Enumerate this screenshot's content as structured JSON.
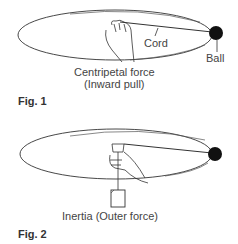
{
  "figures": [
    {
      "id": "fig1",
      "caption": "Fig. 1",
      "labels": {
        "cord": "Cord",
        "ball": "Ball",
        "force_line1": "Centripetal force",
        "force_line2": "(Inward pull)"
      }
    },
    {
      "id": "fig2",
      "caption": "Fig. 2",
      "labels": {
        "force": "Inertia (Outer force)"
      }
    }
  ],
  "colors": {
    "line": "#333333",
    "ball": "#111111"
  }
}
